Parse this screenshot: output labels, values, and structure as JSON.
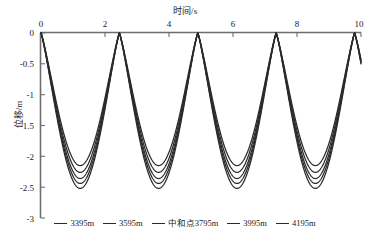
{
  "chart_data": {
    "type": "line",
    "title": "时间/s",
    "xlabel": "时间/s",
    "ylabel": "位移/m",
    "xlim": [
      0,
      10
    ],
    "ylim": [
      -3,
      0
    ],
    "xticks": [
      0,
      2,
      4,
      6,
      8,
      10
    ],
    "xtick_labels": [
      "0",
      "2",
      "4",
      "6",
      "8",
      "10"
    ],
    "yticks": [
      0,
      -0.5,
      -1,
      -1.5,
      -2,
      -2.5,
      -3
    ],
    "ytick_labels": [
      "0",
      "-0.5",
      "-1",
      "-1.5",
      "-2",
      "-2.5",
      "-3"
    ],
    "grid": false,
    "x_axis_position": "top",
    "legend_position": "bottom",
    "period_s": 2.45,
    "line_color": "#2b2b2b",
    "x": [
      0,
      0.1,
      0.2,
      0.3,
      0.4,
      0.5,
      0.6,
      0.7,
      0.8,
      0.9,
      1.0,
      1.1,
      1.2,
      1.3,
      1.4,
      1.5,
      1.6,
      1.7,
      1.8,
      1.9,
      2.0,
      2.1,
      2.2,
      2.3,
      2.4,
      2.45,
      2.6,
      2.8,
      3.0,
      3.2,
      3.4,
      3.6,
      3.675,
      3.9,
      4.1,
      4.3,
      4.5,
      4.7,
      4.9,
      5.1,
      5.3,
      5.5,
      5.7,
      5.9,
      6.125,
      6.3,
      6.5,
      6.7,
      6.9,
      7.1,
      7.35,
      7.6,
      7.8,
      8.0,
      8.2,
      8.4,
      8.575,
      8.8,
      9.0,
      9.2,
      9.4,
      9.6,
      9.8,
      9.9,
      10.0
    ],
    "series": [
      {
        "name": "3395m",
        "amplitude_m": 2.15,
        "min_m": -2.15,
        "values_note": "半波整流型正弦包络, 周期2.45s, 峰值0, 谷值-2.15"
      },
      {
        "name": "3595m",
        "amplitude_m": 2.26,
        "min_m": -2.26,
        "values_note": "半波整流型正弦包络, 周期2.45s, 峰值0, 谷值-2.26"
      },
      {
        "name": "中和点3795m",
        "amplitude_m": 2.36,
        "min_m": -2.36,
        "values_note": "半波整流型正弦包络, 周期2.45s, 峰值0, 谷值-2.36"
      },
      {
        "name": "3995m",
        "amplitude_m": 2.44,
        "min_m": -2.44,
        "values_note": "半波整流型正弦包络, 周期2.45s, 峰值0, 谷值-2.44"
      },
      {
        "name": "4195m",
        "amplitude_m": 2.52,
        "min_m": -2.52,
        "values_note": "半波整流型正弦包络, 周期2.45s, 峰值0, 谷值-2.52"
      }
    ],
    "troughs_x_s": [
      1.225,
      3.675,
      6.125,
      8.575
    ],
    "peaks_x_s": [
      0,
      2.45,
      4.9,
      7.35,
      9.8
    ]
  },
  "legend": {
    "items": [
      {
        "label": "3395m",
        "color": "#2b2b2b"
      },
      {
        "label": "3595m",
        "color": "#2b2b2b"
      },
      {
        "label": "中和点3795m",
        "color": "#2b2b2b"
      },
      {
        "label": "3995m",
        "color": "#2b2b2b"
      },
      {
        "label": "4195m",
        "color": "#2b2b2b"
      }
    ]
  },
  "axes": {
    "title_top": "时间/s",
    "ylabel": "位移/m",
    "x_ticks": [
      "0",
      "2",
      "4",
      "6",
      "8",
      "10"
    ],
    "y_ticks": [
      "0",
      "-0.5",
      "-1",
      "-1.5",
      "-2",
      "-2.5",
      "-3"
    ]
  }
}
